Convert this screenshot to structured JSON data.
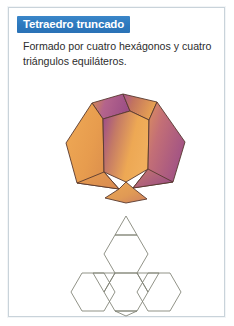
{
  "card": {
    "border_color": "#c9d3da",
    "background": "#ffffff"
  },
  "header": {
    "title": "Tetraedro truncado",
    "banner_color": "#2c78bd",
    "title_color": "#ffffff"
  },
  "body": {
    "description": "Formado por cuatro hexágonos y cuatro triángulos equiláteros.",
    "text_color": "#2d2d2d"
  },
  "figures": {
    "solid": {
      "name": "truncated-tetrahedron-3d",
      "face_count_hexagons": 4,
      "face_count_triangles": 4,
      "colors": {
        "orange": "#e8a04e",
        "orange_light": "#f0b062",
        "purple": "#a5538f",
        "purple_dark": "#8e4a83",
        "edge": "#5a3a30"
      }
    },
    "net": {
      "name": "truncated-tetrahedron-net",
      "stroke_color": "#7d7f72",
      "fill": "none",
      "hexagons": 4,
      "triangles": 4
    }
  }
}
